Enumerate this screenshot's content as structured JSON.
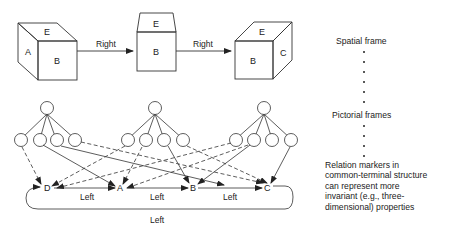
{
  "figure": {
    "cubes": [
      {
        "id": "cube-left",
        "faces": {
          "top": "E",
          "left": "A",
          "front": "B"
        }
      },
      {
        "id": "cube-middle",
        "faces": {
          "top": "E",
          "front": "B"
        }
      },
      {
        "id": "cube-right",
        "faces": {
          "top": "E",
          "front": "B",
          "right": "C"
        }
      }
    ],
    "transition_labels": [
      "Right",
      "Right"
    ],
    "terminal_nodes": [
      "D",
      "A",
      "B",
      "C"
    ],
    "relation_labels": [
      "Left",
      "Left",
      "Left"
    ],
    "loop_label": "Left"
  },
  "annotations": {
    "spatial_frame": "Spatial frame",
    "pictorial_frames": "Pictorial frames",
    "relation_note_lines": [
      "Relation markers in",
      "common-terminal structure",
      "can represent more",
      "invariant (e.g., three-",
      "dimensional) properties"
    ]
  }
}
